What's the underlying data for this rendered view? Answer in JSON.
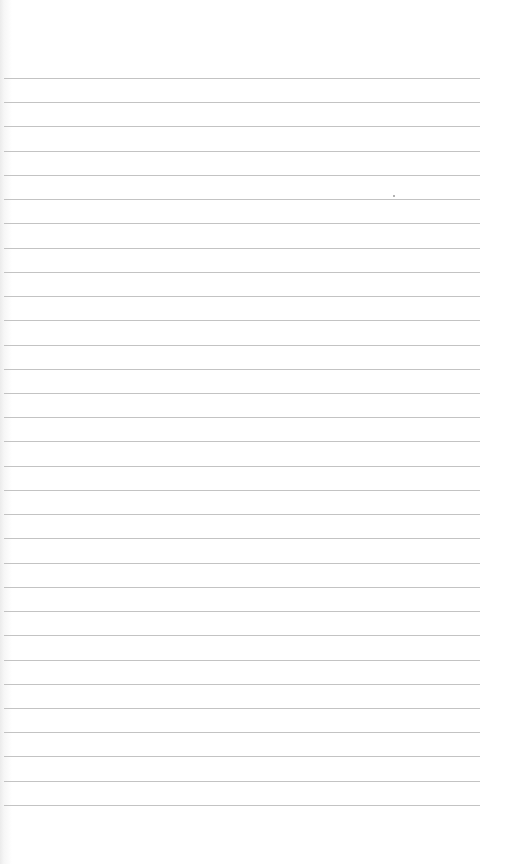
{
  "page": {
    "type": "lined-paper",
    "background_color": "#ffffff",
    "rule_color": "#b9b9b9",
    "rule_count": 31,
    "first_rule_y": 78,
    "rule_spacing": 24.23,
    "rule_left": 4,
    "rule_right": 480
  }
}
